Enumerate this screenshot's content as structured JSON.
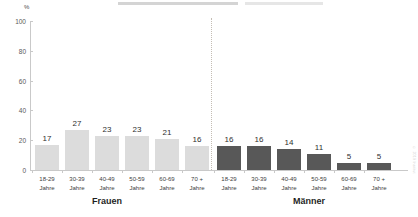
{
  "chart_data": {
    "type": "bar",
    "title": "",
    "xlabel": "",
    "ylabel": "%",
    "ylim": [
      0,
      100
    ],
    "yticks": [
      0,
      20,
      40,
      60,
      80,
      100
    ],
    "grid": false,
    "legend": "none",
    "categories": [
      "18-29 Jahre",
      "30-39 Jahre",
      "40-49 Jahre",
      "50-59 Jahre",
      "60-69 Jahre",
      "70 + Jahre"
    ],
    "series": [
      {
        "name": "Frauen",
        "values": [
          17,
          27,
          23,
          23,
          21,
          16
        ],
        "color": "#dcdcdc"
      },
      {
        "name": "Männer",
        "values": [
          16,
          16,
          14,
          11,
          5,
          5
        ],
        "color": "#585858"
      }
    ]
  },
  "axis": {
    "unit_label": "%",
    "tick_labels": [
      "100",
      "80",
      "60",
      "40",
      "20",
      "0"
    ]
  },
  "groups": [
    {
      "label": "Frauen",
      "categories": [
        {
          "line1": "18-29",
          "line2": "Jahre",
          "value": "17"
        },
        {
          "line1": "30-39",
          "line2": "Jahre",
          "value": "27"
        },
        {
          "line1": "40-49",
          "line2": "Jahre",
          "value": "23"
        },
        {
          "line1": "50-59",
          "line2": "Jahre",
          "value": "23"
        },
        {
          "line1": "60-69",
          "line2": "Jahre",
          "value": "21"
        },
        {
          "line1": "70 +",
          "line2": "Jahre",
          "value": "16"
        }
      ]
    },
    {
      "label": "Männer",
      "categories": [
        {
          "line1": "18-29",
          "line2": "Jahre",
          "value": "16"
        },
        {
          "line1": "30-39",
          "line2": "Jahre",
          "value": "16"
        },
        {
          "line1": "40-49",
          "line2": "Jahre",
          "value": "14"
        },
        {
          "line1": "50-59",
          "line2": "Jahre",
          "value": "11"
        },
        {
          "line1": "60-69",
          "line2": "Jahre",
          "value": "5"
        },
        {
          "line1": "70 +",
          "line2": "Jahre",
          "value": "5"
        }
      ]
    }
  ],
  "credit": "© 2019 Institut"
}
